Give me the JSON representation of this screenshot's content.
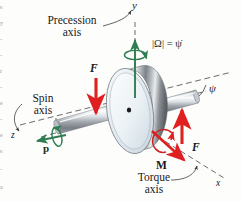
{
  "figure": {
    "kind": "gyroscope-precession-diagram",
    "background_color": "#fdfdfc"
  },
  "axes": [
    {
      "name": "y-axis",
      "label": "y",
      "position": "top"
    },
    {
      "name": "z-axis",
      "label": "z",
      "position": "left"
    },
    {
      "name": "x-axis",
      "label": "x",
      "position": "bottom-right"
    }
  ],
  "annotations": {
    "precession": {
      "line1": "Precession",
      "line2": "axis",
      "rate_formula": "|Ω| = ψ̇",
      "color": "#2f7d52"
    },
    "spin": {
      "line1": "Spin",
      "line2": "axis",
      "vector_label": "p",
      "color": "#2f7d52"
    },
    "torque": {
      "line1": "Torque",
      "line2": "axis",
      "vector_label": "M",
      "color": "#cc2222"
    },
    "angle": {
      "label": "ψ"
    },
    "force_left": {
      "label": "F",
      "direction": "down",
      "color": "#e02020"
    },
    "force_right": {
      "label": "F",
      "direction": "up",
      "color": "#e02020"
    }
  },
  "colors": {
    "green": "#2f7d52",
    "red": "#e02020",
    "dark_red": "#c41e1e",
    "axis_gray": "#56565a",
    "disk_face": "#e6edf2",
    "disk_rim_light": "#f2f4f5",
    "disk_rim_dark": "#5d6166",
    "shaft_light": "#f4f6f7",
    "shaft_dark": "#6e7378",
    "text": "#1a1a1a"
  },
  "edge_text_fragments": [
    "s",
    "y",
    "-",
    "-",
    "r",
    "-",
    "e",
    "-",
    "e",
    "s",
    "-",
    "a"
  ]
}
